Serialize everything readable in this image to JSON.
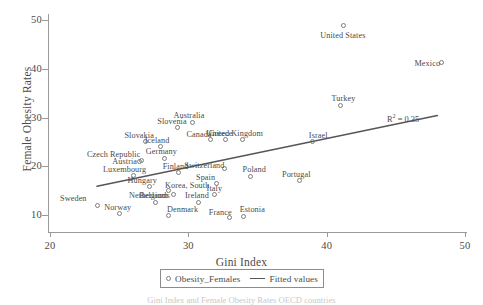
{
  "chart_data": {
    "type": "scatter",
    "title": "",
    "xlabel": "Gini Index",
    "ylabel": "Female Obesity Rates",
    "xlim": [
      20,
      50
    ],
    "ylim": [
      10,
      50
    ],
    "xticks": [
      20,
      30,
      40,
      50
    ],
    "yticks": [
      10,
      20,
      30,
      40,
      50
    ],
    "grid": false,
    "legend_position": "bottom-center",
    "annotations": [
      {
        "text": "R2 = 0.35",
        "display": "R",
        "sup": "2",
        "tail": " = 0.35",
        "x": 46.0,
        "y": 27.5
      }
    ],
    "series": [
      {
        "name": "Obesity_Females",
        "marker": "open-circle",
        "points": [
          {
            "label": "Sweden",
            "x": 23.4,
            "y": 12.0
          },
          {
            "label": "Norway",
            "x": 25.0,
            "y": 10.3
          },
          {
            "label": "Luxembourg",
            "x": 26.0,
            "y": 18.1
          },
          {
            "label": "Austria",
            "x": 26.6,
            "y": 21.1
          },
          {
            "label": "Czech Republic",
            "x": 26.5,
            "y": 21.0
          },
          {
            "label": "Slovakia",
            "x": 26.9,
            "y": 25.0
          },
          {
            "label": "Hungary",
            "x": 27.2,
            "y": 15.9
          },
          {
            "label": "Belgium",
            "x": 27.6,
            "y": 12.6
          },
          {
            "label": "Denmark",
            "x": 28.6,
            "y": 10.0
          },
          {
            "label": "Germany",
            "x": 28.3,
            "y": 21.6
          },
          {
            "label": "Iceland",
            "x": 28.0,
            "y": 24.0
          },
          {
            "label": "Korea, South",
            "x": 28.6,
            "y": 15.0
          },
          {
            "label": "Netherlands",
            "x": 28.9,
            "y": 14.3
          },
          {
            "label": "Slovenia",
            "x": 29.2,
            "y": 27.9
          },
          {
            "label": "Finland",
            "x": 29.3,
            "y": 18.7
          },
          {
            "label": "Australia",
            "x": 30.3,
            "y": 29.0
          },
          {
            "label": "Ireland",
            "x": 30.7,
            "y": 12.6
          },
          {
            "label": "Italy",
            "x": 31.9,
            "y": 14.2
          },
          {
            "label": "Canada",
            "x": 31.6,
            "y": 25.4
          },
          {
            "label": "Spain",
            "x": 32.0,
            "y": 16.5
          },
          {
            "label": "Greece",
            "x": 32.7,
            "y": 25.4
          },
          {
            "label": "Switzerland",
            "x": 32.6,
            "y": 19.5
          },
          {
            "label": "France",
            "x": 33.0,
            "y": 9.4
          },
          {
            "label": "Estonia",
            "x": 34.0,
            "y": 9.7
          },
          {
            "label": "United Kingdom",
            "x": 33.9,
            "y": 25.4
          },
          {
            "label": "Poland",
            "x": 34.5,
            "y": 18.0
          },
          {
            "label": "Portugal",
            "x": 38.0,
            "y": 17.0
          },
          {
            "label": "Israel",
            "x": 39.0,
            "y": 25.0
          },
          {
            "label": "Turkey",
            "x": 41.0,
            "y": 32.5
          },
          {
            "label": "United States",
            "x": 41.2,
            "y": 48.8
          },
          {
            "label": "Mexico",
            "x": 48.3,
            "y": 41.2
          }
        ]
      }
    ],
    "fit": {
      "name": "Fitted values",
      "x_start": 23.4,
      "y_start": 15.9,
      "x_end": 48.0,
      "y_end": 30.4,
      "r_squared": 0.35
    }
  },
  "legend": {
    "entries": [
      {
        "label": "Obesity_Females",
        "marker": "open-circle-marker"
      },
      {
        "label": "Fitted values",
        "marker": "line-marker"
      }
    ]
  },
  "axes": {
    "y_title": "Female Obesity Rates",
    "x_title": "Gini Index",
    "y_tick_labels": [
      "50",
      "40",
      "30",
      "20",
      "10"
    ],
    "x_tick_labels": [
      "20",
      "30",
      "40",
      "50"
    ]
  },
  "colors": {
    "marker_stroke": "#7d7d7d",
    "fit_line": "#55565a",
    "axis": "#9a9a9a",
    "text": "#4a4a4a",
    "background": "#ffffff"
  },
  "caption": {
    "text": "Gini Index and Female Obesity Rates OECD countries"
  },
  "point_label_offsets": {
    "Sweden": {
      "dx": -37,
      "dy": -11
    },
    "Norway": {
      "dx": -15,
      "dy": -11
    },
    "Luxembourg": {
      "dx": -30,
      "dy": -11
    },
    "Austria": {
      "dx": -29,
      "dy": -4
    },
    "Czech Republic": {
      "dx": -53,
      "dy": -11
    },
    "Slovakia": {
      "dx": -21,
      "dy": -11
    },
    "Hungary": {
      "dx": -22,
      "dy": -10
    },
    "Belgium": {
      "dx": -16,
      "dy": -11
    },
    "Denmark": {
      "dx": -2,
      "dy": -10
    },
    "Germany": {
      "dx": -19,
      "dy": -11
    },
    "Iceland": {
      "dx": -16,
      "dy": -11
    },
    "Korea, South": {
      "dx": -4,
      "dy": -10
    },
    "Netherlands": {
      "dx": -44,
      "dy": -3
    },
    "Slovenia": {
      "dx": -20,
      "dy": -11
    },
    "Finland": {
      "dx": -16,
      "dy": -11
    },
    "Australia": {
      "dx": -19,
      "dy": -11
    },
    "Ireland": {
      "dx": -13,
      "dy": -11
    },
    "Italy": {
      "dx": -8,
      "dy": -11
    },
    "Canada": {
      "dx": -24,
      "dy": -10
    },
    "Spain": {
      "dx": -20,
      "dy": -10
    },
    "Greece": {
      "dx": -17,
      "dy": -11
    },
    "Switzerland": {
      "dx": -40,
      "dy": -8
    },
    "France": {
      "dx": -21,
      "dy": -10
    },
    "Estonia": {
      "dx": -4,
      "dy": -11
    },
    "United Kingdom": {
      "dx": -36,
      "dy": -11
    },
    "Poland": {
      "dx": -8,
      "dy": -11
    },
    "Portugal": {
      "dx": -17,
      "dy": -11
    },
    "Israel": {
      "dx": -4,
      "dy": -11
    },
    "Turkey": {
      "dx": -9,
      "dy": -11
    },
    "United States": {
      "dx": -23,
      "dy": 5
    },
    "Mexico": {
      "dx": -27,
      "dy": -4
    }
  }
}
